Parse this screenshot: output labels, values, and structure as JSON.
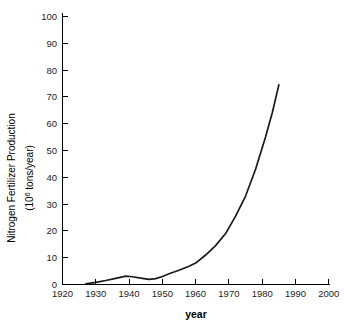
{
  "chart_data": {
    "type": "line",
    "title": "",
    "subtitle": "",
    "xlabel": "year",
    "ylabel": "Nitrogen Fertilizer Production",
    "ylabel_units": "(10⁶ tons/year)",
    "ylabel_line1": "Nitrogen Fertilizer Production",
    "ylabel_line2_prefix": "(10",
    "ylabel_line2_sup": "6",
    "ylabel_line2_suffix": " tons/year)",
    "xlim": [
      1920,
      2000
    ],
    "ylim": [
      0,
      100
    ],
    "xticks": [
      1920,
      1930,
      1940,
      1950,
      1960,
      1970,
      1980,
      1990,
      2000
    ],
    "xtick_labels": [
      "1920",
      "1930",
      "1940",
      "1950",
      "1960",
      "1970",
      "1980",
      "1990",
      "2000"
    ],
    "yticks": [
      0,
      10,
      20,
      30,
      40,
      50,
      60,
      70,
      80,
      90,
      100
    ],
    "ytick_labels": [
      "0",
      "10",
      "20",
      "30",
      "40",
      "50",
      "60",
      "70",
      "80",
      "90",
      "100"
    ],
    "grid": false,
    "legend": false,
    "legend_position": "none",
    "line_color": "#1a1a1a",
    "background_color": "#ffffff",
    "axis_color": "#000000",
    "spines": [
      "left",
      "bottom"
    ],
    "series": [
      {
        "name": "Nitrogen fertilizer production",
        "x": [
          1927,
          1930,
          1933,
          1936,
          1939,
          1941,
          1944,
          1946,
          1948,
          1950,
          1952,
          1955,
          1958,
          1960,
          1963,
          1966,
          1969,
          1972,
          1975,
          1978,
          1981,
          1983,
          1985
        ],
        "values": [
          0.2,
          0.8,
          1.5,
          2.3,
          3.1,
          2.9,
          2.3,
          1.9,
          2.2,
          3.0,
          4.0,
          5.3,
          6.8,
          8.0,
          11.0,
          14.5,
          19.0,
          25.5,
          33.0,
          43.0,
          55.0,
          64.0,
          74.5
        ]
      }
    ],
    "annotations": []
  }
}
